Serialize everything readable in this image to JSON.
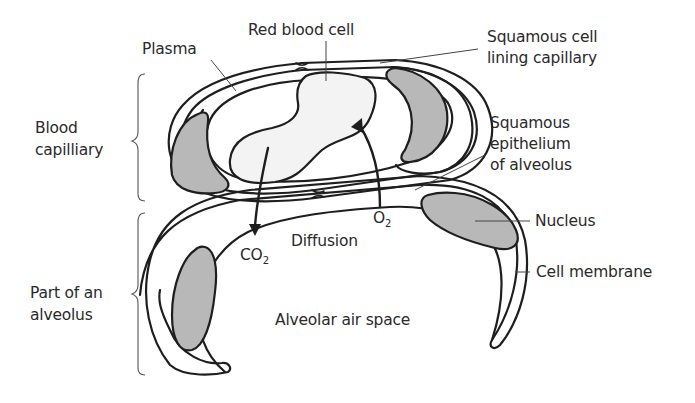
{
  "diagram": {
    "colors": {
      "outline": "#1e1e1e",
      "nucleus_fill": "#b8b8b8",
      "red_cell_fill": "#f3f3f3",
      "text": "#2a2a2a",
      "leader": "#444444"
    },
    "labels": {
      "plasma": "Plasma",
      "red_blood_cell": "Red blood cell",
      "squamous_lining_1": "Squamous cell",
      "squamous_lining_2": "lining capillary",
      "blood_capillary_1": "Blood",
      "blood_capillary_2": "capilliary",
      "squamous_epi_1": "Squamous",
      "squamous_epi_2": "epithelium",
      "squamous_epi_3": "of alveolus",
      "nucleus": "Nucleus",
      "diffusion": "Diffusion",
      "co2_base": "CO",
      "co2_sub": "2",
      "o2_base": "O",
      "o2_sub": "2",
      "cell_membrane": "Cell membrane",
      "alveolus_1": "Part of an",
      "alveolus_2": "alveolus",
      "air_space": "Alveolar air space"
    },
    "groups": [
      {
        "name": "Blood capilliary",
        "bracket_range_y": [
          73,
          200
        ]
      },
      {
        "name": "Part of an alveolus",
        "bracket_range_y": [
          212,
          375
        ]
      }
    ],
    "arrows": [
      {
        "name": "CO2 diffusion",
        "direction": "from red blood cell to alveolar air space"
      },
      {
        "name": "O2 diffusion",
        "direction": "from alveolar air space into red blood cell"
      }
    ]
  }
}
